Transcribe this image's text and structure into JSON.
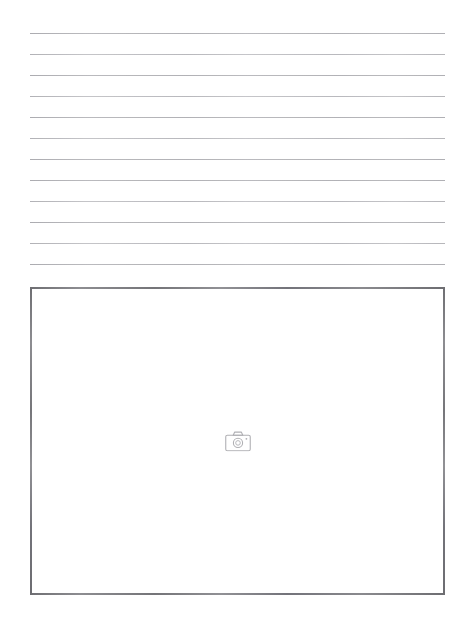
{
  "page": {
    "width": 471,
    "height": 628,
    "background_color": "#ffffff",
    "kind": "worksheet-page"
  },
  "writing_area": {
    "name": "ruled-writing-area",
    "line_count": 12,
    "line_color": "#b9b9bd",
    "line_left": 30,
    "line_right": 445,
    "line_spacing": 21,
    "first_line_y": 33,
    "lines": [
      {
        "y": 33,
        "faint": false
      },
      {
        "y": 54,
        "faint": true
      },
      {
        "y": 75,
        "faint": false
      },
      {
        "y": 96,
        "faint": true
      },
      {
        "y": 117,
        "faint": false
      },
      {
        "y": 138,
        "faint": true
      },
      {
        "y": 159,
        "faint": false
      },
      {
        "y": 180,
        "faint": false
      },
      {
        "y": 201,
        "faint": true
      },
      {
        "y": 222,
        "faint": false
      },
      {
        "y": 243,
        "faint": true
      },
      {
        "y": 264,
        "faint": false
      }
    ]
  },
  "photo_frame": {
    "name": "image-placeholder-frame",
    "x": 30,
    "y": 287,
    "width": 415,
    "height": 308,
    "border_color": "#7c7c80",
    "border_width": 2,
    "fill_color": "#ffffff",
    "icon": {
      "name": "camera-icon",
      "semantic": "image-placeholder",
      "color": "#b0b0b4",
      "width": 26,
      "height": 21,
      "center_x": 238,
      "center_y": 441
    }
  },
  "labels": {
    "page_title": "Lined worksheet with photo placeholder",
    "writing_area_label": "Lined writing area",
    "photo_frame_label": "Photo placeholder box",
    "icon_label": "Image placeholder"
  }
}
